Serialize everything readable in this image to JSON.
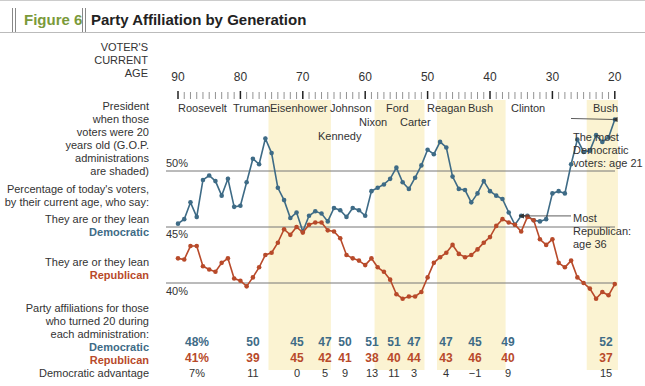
{
  "header": {
    "figure_label": "Figure 6",
    "title": "Party Affiliation by Generation"
  },
  "left_labels": {
    "age_axis": [
      "VOTER'S",
      "CURRENT",
      "AGE"
    ],
    "president": [
      "President",
      "when those",
      "voters were 20",
      "years old (G.O.P.",
      "administrations",
      "are shaded)"
    ],
    "percentage": [
      "Percentage of today's voters,",
      "by their current age, who say:"
    ],
    "dem_lean": "They are or they lean",
    "dem_name": "Democratic",
    "rep_lean": "They are or they lean",
    "rep_name": "Republican",
    "affil": [
      "Party affiliations for those",
      "who turned 20 during",
      "each administration:"
    ],
    "row_dem": "Democratic",
    "row_rep": "Republican",
    "row_adv": "Democratic advantage"
  },
  "y_labels": {
    "p50": "50%",
    "p45": "45%",
    "p40": "40%"
  },
  "annotations": {
    "most_dem": [
      "The most",
      "Democratic",
      "voters: age 21"
    ],
    "most_rep": [
      "Most",
      "Republican:",
      "age 36"
    ]
  },
  "colors": {
    "democratic": "#3e6b86",
    "republican": "#b84a2a",
    "shade": "#fbf3d2",
    "green_label": "#7a9a3a"
  },
  "chart_data": {
    "type": "line",
    "title": "Party Affiliation by Generation",
    "xlabel": "Voter's current age",
    "ylabel": "Percentage of today's voters",
    "x_ticks": [
      90,
      80,
      70,
      60,
      50,
      40,
      30,
      20
    ],
    "x_range": [
      90,
      20
    ],
    "ylim": [
      38.5,
      55.5
    ],
    "gridlines": [
      50,
      45,
      40
    ],
    "gop_shaded": [
      {
        "president": "Eisenhower",
        "age_from": 75,
        "age_to": 66
      },
      {
        "president": "Nixon-Ford",
        "age_from": 58,
        "age_to": 51
      },
      {
        "president": "Reagan-Bush",
        "age_from": 48,
        "age_to": 38
      },
      {
        "president": "Bush",
        "age_from": 24,
        "age_to": 20
      }
    ],
    "presidents": [
      {
        "name": "Roosevelt",
        "x": 178,
        "y": 108
      },
      {
        "name": "Truman",
        "x": 233,
        "y": 108
      },
      {
        "name": "Eisenhower",
        "x": 270,
        "y": 108
      },
      {
        "name": "Kennedy",
        "x": 318,
        "y": 136
      },
      {
        "name": "Johnson",
        "x": 330,
        "y": 108
      },
      {
        "name": "Nixon",
        "x": 359,
        "y": 122
      },
      {
        "name": "Ford",
        "x": 386,
        "y": 108
      },
      {
        "name": "Carter",
        "x": 400,
        "y": 122
      },
      {
        "name": "Reagan",
        "x": 427,
        "y": 108
      },
      {
        "name": "Bush",
        "x": 468,
        "y": 108
      },
      {
        "name": "Clinton",
        "x": 511,
        "y": 108
      },
      {
        "name": "Bush",
        "x": 593,
        "y": 108
      }
    ],
    "series": [
      {
        "name": "Democratic",
        "ages": [
          90,
          89,
          88,
          87,
          86,
          85,
          84,
          83,
          82,
          81,
          80,
          79,
          78,
          77,
          76,
          75,
          74,
          73,
          72,
          71,
          70,
          69,
          68,
          67,
          66,
          65,
          64,
          63,
          62,
          61,
          60,
          59,
          58,
          57,
          56,
          55,
          54,
          53,
          52,
          51,
          50,
          49,
          48,
          47,
          46,
          45,
          44,
          43,
          42,
          41,
          40,
          39,
          38,
          37,
          36,
          35,
          34,
          33,
          32,
          31,
          30,
          29,
          28,
          27,
          26,
          25,
          24,
          23,
          22,
          21,
          20
        ],
        "values": [
          45.3,
          45.7,
          47.2,
          45.9,
          49.2,
          49.6,
          49.1,
          47.8,
          49.3,
          46.8,
          46.9,
          49.0,
          51.1,
          50.6,
          52.9,
          51.6,
          48.5,
          47.4,
          45.8,
          46.3,
          44.6,
          46.0,
          46.4,
          46.2,
          45.5,
          46.7,
          46.5,
          45.9,
          46.7,
          46.5,
          46.0,
          48.2,
          48.5,
          48.8,
          49.3,
          50.3,
          49.0,
          48.4,
          49.4,
          50.5,
          51.9,
          51.5,
          52.6,
          52.1,
          49.5,
          48.4,
          48.3,
          47.2,
          48.0,
          49.1,
          48.2,
          47.8,
          47.5,
          46.3,
          45.2,
          46.0,
          46.0,
          45.6,
          45.5,
          45.7,
          48.0,
          48.2,
          48.0,
          50.6,
          52.8,
          51.7,
          51.8,
          53.2,
          52.6,
          53.0,
          54.6,
          53.2
        ],
        "note": "Peak at age 21"
      },
      {
        "name": "Republican",
        "ages": [
          90,
          89,
          88,
          87,
          86,
          85,
          84,
          83,
          82,
          81,
          80,
          79,
          78,
          77,
          76,
          75,
          74,
          73,
          72,
          71,
          70,
          69,
          68,
          67,
          66,
          65,
          64,
          63,
          62,
          61,
          60,
          59,
          58,
          57,
          56,
          55,
          54,
          53,
          52,
          51,
          50,
          49,
          48,
          47,
          46,
          45,
          44,
          43,
          42,
          41,
          40,
          39,
          38,
          37,
          36,
          35,
          34,
          33,
          32,
          31,
          30,
          29,
          28,
          27,
          26,
          25,
          24,
          23,
          22,
          21,
          20
        ],
        "values": [
          42.2,
          42.1,
          43.3,
          43.3,
          41.5,
          41.2,
          41.0,
          41.8,
          42.2,
          40.4,
          40.2,
          39.7,
          40.5,
          41.4,
          42.5,
          42.7,
          43.6,
          44.8,
          44.3,
          45.0,
          44.5,
          45.2,
          45.4,
          45.4,
          44.7,
          44.6,
          44.0,
          42.5,
          42.2,
          42.0,
          41.6,
          42.2,
          41.4,
          41.0,
          40.3,
          39.0,
          38.6,
          38.8,
          38.8,
          39.2,
          40.5,
          41.8,
          42.3,
          42.7,
          43.4,
          42.6,
          42.3,
          42.5,
          43.0,
          43.6,
          44.1,
          45.1,
          45.7,
          45.4,
          45.2,
          44.6,
          45.9,
          45.6,
          43.9,
          43.4,
          43.9,
          41.8,
          41.4,
          42.0,
          40.5,
          40.0,
          39.5,
          38.6,
          39.2,
          38.9,
          39.9
        ],
        "note": "Peak at age 36"
      }
    ],
    "table": {
      "columns": [
        "Roosevelt",
        "Truman",
        "Eisenhower",
        "Kennedy",
        "Johnson",
        "Nixon",
        "Ford",
        "Carter",
        "Reagan",
        "Bush",
        "Clinton",
        "Bush"
      ],
      "democratic": [
        "48%",
        "50",
        "45",
        "47",
        "50",
        "51",
        "51",
        "47",
        "47",
        "45",
        "49",
        "52"
      ],
      "republican": [
        "41%",
        "39",
        "45",
        "42",
        "41",
        "38",
        "40",
        "44",
        "43",
        "46",
        "40",
        "37"
      ],
      "dem_advantage": [
        "7%",
        "11",
        "0",
        "5",
        "9",
        "13",
        "11",
        "3",
        "4",
        "−1",
        "9",
        "15"
      ]
    }
  }
}
